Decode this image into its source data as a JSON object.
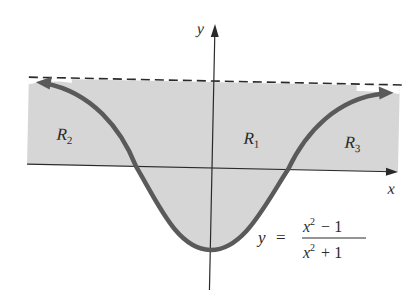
{
  "figure": {
    "axes": {
      "x_label": "x",
      "y_label": "y"
    },
    "regions": [
      {
        "id": "R1",
        "label": "R",
        "subscript": "1"
      },
      {
        "id": "R2",
        "label": "R",
        "subscript": "2"
      },
      {
        "id": "R3",
        "label": "R",
        "subscript": "3"
      }
    ],
    "equation": {
      "lhs": "y",
      "equals": "=",
      "numerator_base": "x",
      "numerator_exp": "2",
      "numerator_rest": "− 1",
      "denominator_base": "x",
      "denominator_exp": "2",
      "denominator_rest": "+ 1"
    },
    "asymptote": "y = 1 (dashed)",
    "colors": {
      "shade": "#d6d6d6",
      "curve": "#5a5a5a",
      "axis": "#2a2a2a"
    }
  }
}
